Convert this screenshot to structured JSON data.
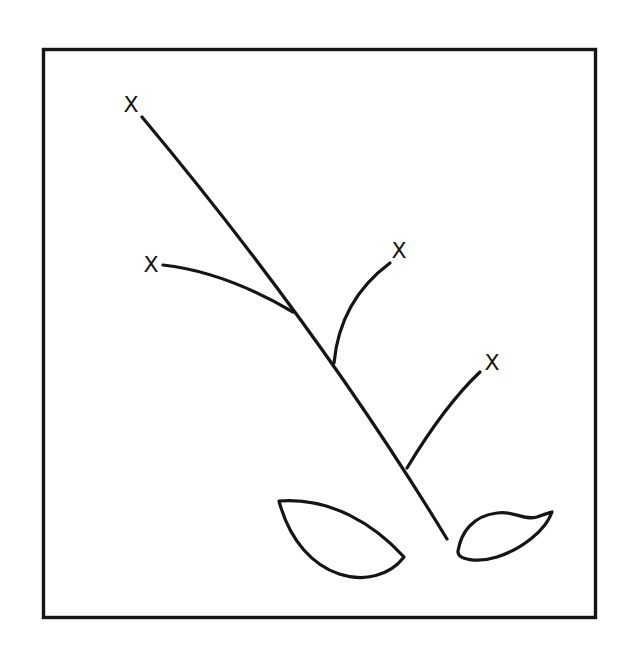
{
  "figure": {
    "background_color": "#ffffff",
    "stroke_color": "#151515",
    "stroke_width": 3.2,
    "frame": {
      "x": 43.5,
      "y": 49.5,
      "width": 552,
      "height": 568,
      "stroke_width": 3.4
    },
    "marks": [
      {
        "label": "X",
        "x": 131,
        "y": 104,
        "font_size": 22
      },
      {
        "label": "X",
        "x": 151,
        "y": 264,
        "font_size": 22
      },
      {
        "label": "X",
        "x": 399,
        "y": 250,
        "font_size": 22
      },
      {
        "label": "X",
        "x": 492,
        "y": 362,
        "font_size": 22
      }
    ],
    "parts": [
      {
        "name": "main-stem",
        "path": "M142,117 Q320,330 447,539",
        "closed": false
      },
      {
        "name": "branch-left",
        "path": "M163,265 Q225,272 293,312",
        "closed": false
      },
      {
        "name": "branch-upper-right",
        "path": "M390,263 Q340,300 334,363",
        "closed": false
      },
      {
        "name": "branch-lower-right",
        "path": "M480,372 Q445,405 407,468",
        "closed": false
      },
      {
        "name": "leaf-left",
        "path": "M279,501 C330,497 374,524 404,557 C376,594 301,584 279,501 Z",
        "closed": true
      },
      {
        "name": "leaf-right",
        "path": "M458,551 C461,533 472,516 497,513 C514,510 523,521 537,517 C545,514 549,513 552,512 C546,530 522,549 497,557 C478,563 457,560 458,551 Z",
        "closed": true
      }
    ]
  }
}
